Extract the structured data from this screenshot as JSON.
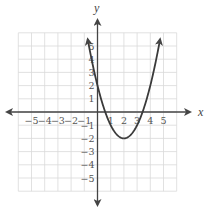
{
  "chart_data": {
    "type": "line",
    "title": "",
    "xlabel": "x",
    "ylabel": "y",
    "function": "y = x^2 - 4x + 2",
    "vertex": [
      2,
      -2
    ],
    "y_intercept": 2,
    "x_intercepts": [
      0.59,
      3.41
    ],
    "xlim": [
      -6,
      6
    ],
    "ylim": [
      -6,
      6
    ],
    "grid": true,
    "x_ticks": [
      -5,
      -4,
      -3,
      -2,
      -1,
      1,
      2,
      3,
      4,
      5
    ],
    "y_ticks": [
      5,
      4,
      3,
      2,
      1,
      -1,
      -2,
      -3,
      -4,
      -5
    ],
    "x_tick_labels": [
      "−5",
      "−4",
      "−3",
      "−2",
      "−1",
      "1",
      "2",
      "3",
      "4",
      "5"
    ],
    "y_tick_labels": [
      "5",
      "4",
      "3",
      "2",
      "1",
      "−1",
      "−2",
      "−3",
      "−4",
      "−5"
    ],
    "series": [
      {
        "name": "parabola",
        "x": [
          -0.74,
          -0.5,
          0,
          0.5,
          1,
          1.5,
          2,
          2.5,
          3,
          3.5,
          4,
          4.5,
          4.74
        ],
        "y": [
          5.5,
          4.25,
          2,
          0.25,
          -1,
          -1.75,
          -2,
          -1.75,
          -1,
          0.25,
          2,
          4.25,
          5.5
        ]
      }
    ],
    "arrows": {
      "curve_ends": true,
      "axes": true
    }
  },
  "labels": {
    "x_axis": "x",
    "y_axis": "y"
  },
  "colors": {
    "grid": "#d9d9d9",
    "axis": "#444444",
    "curve": "#3a3a3a",
    "text": "#555555"
  }
}
